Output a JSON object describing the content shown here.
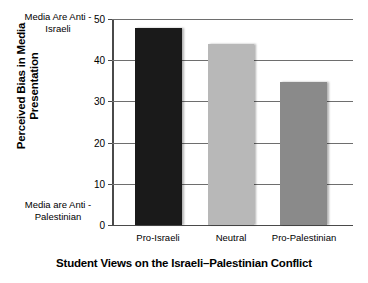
{
  "chart_data": {
    "type": "bar",
    "title": "",
    "categories": [
      "Pro-Israeli",
      "Neutral",
      "Pro-Palestinian"
    ],
    "values": [
      47.8,
      44,
      34.6
    ],
    "series": [
      {
        "name": "Perceived Bias in Media Presentation",
        "values": [
          47.8,
          44,
          34.6
        ]
      }
    ],
    "xlabel": "Student Views on the Israeli–Palestinian Conflict",
    "ylabel": "Perceived Bias in Media Presentation",
    "ylim": [
      0,
      50
    ],
    "yticks": [
      0,
      10,
      20,
      30,
      40,
      50
    ],
    "yticklabels": [
      "0",
      "10",
      "20",
      "30",
      "40",
      "50"
    ],
    "grid": true,
    "legend": false,
    "bar_colors": [
      "#1a1a1a",
      "#b8b8b8",
      "#8a8a8a"
    ],
    "annotations": [
      "Media Are Anti - Israeli",
      "Media are Anti - Palestinian"
    ]
  },
  "axis": {
    "y_title_line1": "Perceived Bias in Media",
    "y_title_line2": "Presentation",
    "x_title": "Student Views on the Israeli–Palestinian Conflict",
    "anchor_high_line1": "Media Are Anti -",
    "anchor_high_line2": "Israeli",
    "anchor_low_line1": "Media are Anti -",
    "anchor_low_line2": "Palestinian"
  },
  "ticks": {
    "t0": "0",
    "t10": "10",
    "t20": "20",
    "t30": "30",
    "t40": "40",
    "t50": "50"
  },
  "categories": {
    "c0": "Pro-Israeli",
    "c1": "Neutral",
    "c2": "Pro-Palestinian"
  },
  "colors": {
    "bar_pro_israeli": "#1a1a1a",
    "bar_neutral": "#b8b8b8",
    "bar_pro_palestinian": "#8a8a8a",
    "axis": "#4a4a4a",
    "grid": "#6e6e6e",
    "background": "#ffffff"
  }
}
